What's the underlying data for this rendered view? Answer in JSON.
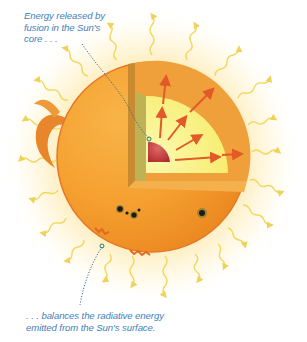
{
  "diagram": {
    "captions": {
      "top": {
        "line1": "Energy released by",
        "line2": "fusion in the Sun's",
        "line3": "core . . ."
      },
      "bottom": {
        "line1": ". . . balances the radiative energy",
        "line2": "emitted from the Sun's surface."
      }
    },
    "labels": {
      "core": "core",
      "surface": "surface",
      "radiation": "radiative energy",
      "sunspots": "sunspots",
      "prominence": "prominence",
      "energy_arrows": "outward energy flow"
    },
    "colors": {
      "caption_text": "#3f7fb9",
      "leader_line": "#2f6e9e",
      "sun_surface": "#f5a030",
      "sun_edge": "#e4782a",
      "cut_face_outer": "#f1a23a",
      "radiative_zone": "#f7f07a",
      "inner_face": "#c9b24a",
      "core": "#c8343a",
      "arrows": "#e25a28",
      "rays": "#f1d85a",
      "sunspot": "#1b1b1b",
      "glow": "#fdeaa0"
    }
  }
}
